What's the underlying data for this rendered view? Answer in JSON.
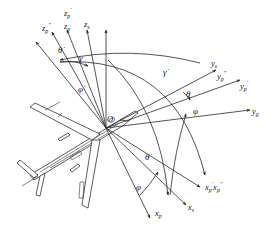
{
  "diagram": {
    "title": "",
    "origin_label": "O",
    "axes": [
      {
        "id": "zp2",
        "symbol": "z",
        "sub": "p",
        "sup": "″",
        "text": "z_p''"
      },
      {
        "id": "zp1",
        "symbol": "z",
        "sub": "p",
        "sup": "′",
        "text": "z_p'"
      },
      {
        "id": "zp",
        "symbol": "z",
        "sub": "p",
        "sup": "",
        "text": "z_p"
      },
      {
        "id": "zs",
        "symbol": "z",
        "sub": "s",
        "sup": "",
        "text": "z_s"
      },
      {
        "id": "ys",
        "symbol": "y",
        "sub": "s",
        "sup": "",
        "text": "y_s"
      },
      {
        "id": "yp2",
        "symbol": "y",
        "sub": "p",
        "sup": "″",
        "text": "y_p''"
      },
      {
        "id": "yp1",
        "symbol": "y",
        "sub": "p",
        "sup": "′",
        "text": "y_p'"
      },
      {
        "id": "yg",
        "symbol": "y",
        "sub": "g",
        "sup": "",
        "text": "y_g"
      },
      {
        "id": "xp12",
        "symbol": "x",
        "sub": "p",
        "sup": "′",
        "text": "x_p' x_p''"
      },
      {
        "id": "xs",
        "symbol": "x",
        "sub": "s",
        "sup": "",
        "text": "x_s"
      },
      {
        "id": "xp",
        "symbol": "x",
        "sub": "p",
        "sup": "",
        "text": "x_p"
      }
    ],
    "angles": {
      "theta_dot_top": "θ̇",
      "gamma": "γ",
      "phi_dot": "φ̇",
      "gamma_dot": "γ̇",
      "theta": "θ",
      "phi_right": "φ",
      "theta_dot_bottom": "θ̇",
      "phi_bottom": "φ"
    },
    "labels": {
      "zp2": "z",
      "zp2_sub": "p",
      "zp2_sup": "″",
      "zp1": "z",
      "zp1_sub": "p",
      "zp1_sup": "′",
      "zp": "z",
      "zp_sub": "p",
      "zs": "z",
      "zs_sub": "s",
      "ys": "y",
      "ys_sub": "s",
      "yp2": "y",
      "yp2_sub": "p",
      "yp2_sup": "″",
      "yp1": "y",
      "yp1_sub": "p",
      "yp1_sup": "′",
      "yg": "y",
      "yg_sub": "g",
      "xp12_a": "x",
      "xp12_a_sub": "p",
      "xp12_a_sup": "′",
      "xp12_b": "x",
      "xp12_b_sub": "p",
      "xp12_b_sup": "″",
      "xs": "x",
      "xs_sub": "s",
      "xp": "x",
      "xp_sub": "p"
    }
  }
}
